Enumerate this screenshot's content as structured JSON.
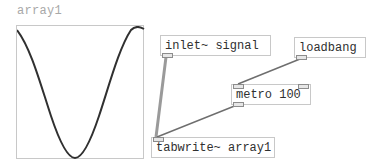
{
  "array": {
    "name": "array1",
    "graph_shape": "cosine-one-period",
    "curve_color": "#303030",
    "border_color": "#c8c8c8"
  },
  "objects": [
    {
      "id": "inlet",
      "text": "inlet~ signal"
    },
    {
      "id": "loadbang",
      "text": "loadbang"
    },
    {
      "id": "metro",
      "text": "metro 100"
    },
    {
      "id": "tabwrite",
      "text": "tabwrite~ array1"
    }
  ],
  "connections": [
    {
      "from": "inlet",
      "to": "tabwrite",
      "type": "signal"
    },
    {
      "from": "loadbang",
      "to": "metro",
      "type": "control"
    },
    {
      "from": "metro",
      "to": "tabwrite",
      "type": "control"
    }
  ],
  "colors": {
    "signal_cord": "#9a9a9a",
    "control_cord": "#6e6e6e",
    "object_border": "#c8c8c8",
    "label_text": "#a8a8a8"
  }
}
